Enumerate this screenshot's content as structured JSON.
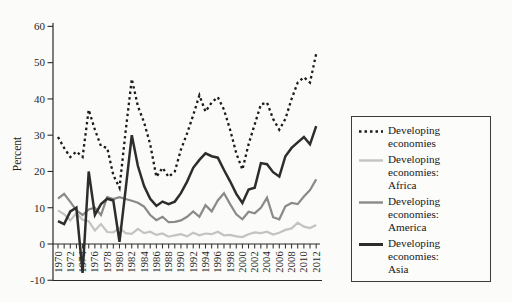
{
  "figure": {
    "background": "#fbfbf9",
    "axis_color": "#2a2a2a",
    "text_color": "#1f1f1f"
  },
  "chart_data": {
    "type": "line",
    "title": "",
    "xlabel": "",
    "ylabel": "Percent",
    "ylim": [
      -10,
      60
    ],
    "y_ticks": [
      60,
      50,
      40,
      30,
      20,
      10,
      0,
      -10
    ],
    "grid": "off",
    "legend_position": "right-box",
    "years": [
      1970,
      1971,
      1972,
      1973,
      1974,
      1975,
      1976,
      1977,
      1978,
      1979,
      1980,
      1981,
      1982,
      1983,
      1984,
      1985,
      1986,
      1987,
      1988,
      1989,
      1990,
      1991,
      1992,
      1993,
      1994,
      1995,
      1996,
      1997,
      1998,
      1999,
      2000,
      2001,
      2002,
      2003,
      2004,
      2005,
      2006,
      2007,
      2008,
      2009,
      2010,
      2011,
      2012
    ],
    "x_tick_labels": [
      "1970",
      "1972",
      "1974",
      "1976",
      "1978",
      "1980",
      "1982",
      "1984",
      "1986",
      "1988",
      "1990",
      "1992",
      "1994",
      "1996",
      "1998",
      "2000",
      "2002",
      "2004",
      "2006",
      "2008",
      "2010",
      "2012"
    ],
    "series": [
      {
        "name": "Developing economies",
        "style": "dotted",
        "color": "#1b1b1b",
        "width": 2.3,
        "values": [
          29.5,
          26.5,
          24,
          25.5,
          24,
          37,
          31.5,
          27,
          26.5,
          19,
          15.5,
          31,
          45.5,
          38,
          33.5,
          27.5,
          18.5,
          21,
          18.5,
          20,
          26,
          30.5,
          35.5,
          41,
          36.5,
          39,
          40.5,
          37,
          31.5,
          25,
          20.5,
          27.5,
          33,
          38.5,
          39,
          34.5,
          31.5,
          34.5,
          40,
          44.5,
          46,
          44.5,
          52.5
        ]
      },
      {
        "name": "Developing economies: Africa",
        "style": "solid",
        "color": "#c3c3c1",
        "width": 2.2,
        "values": [
          9.3,
          8.2,
          6.5,
          8.5,
          6.7,
          6.3,
          3.7,
          5.5,
          3.3,
          3.2,
          4.4,
          3,
          2.8,
          4.2,
          3,
          3.4,
          2.5,
          2.9,
          2,
          2.4,
          2.7,
          2.1,
          3.1,
          2.4,
          2.9,
          2.7,
          3.4,
          2.4,
          2.5,
          2.1,
          1.9,
          2.7,
          3.2,
          3,
          3.4,
          2.6,
          3.1,
          3.9,
          4.3,
          5.9,
          4.8,
          4.4,
          5.2
        ]
      },
      {
        "name": "Developing economies: America",
        "style": "solid",
        "color": "#8a8a88",
        "width": 2.2,
        "values": [
          12.5,
          13.8,
          11.6,
          9.3,
          8,
          9.5,
          10,
          8,
          12.9,
          12.4,
          12.9,
          12.4,
          11.9,
          11.4,
          10.3,
          8,
          6.6,
          7.5,
          6,
          6.1,
          6.5,
          7.5,
          9,
          7.5,
          10.7,
          9,
          12,
          14,
          11,
          8.2,
          6.8,
          8.9,
          8.5,
          10,
          12.8,
          7.4,
          6.8,
          10.4,
          11.3,
          11,
          13.1,
          14.9,
          17.8
        ]
      },
      {
        "name": "Developing economies: Asia",
        "style": "solid",
        "color": "#2d2d2d",
        "width": 2.5,
        "values": [
          6.3,
          5.5,
          9,
          10,
          -8,
          20,
          8,
          11,
          12.5,
          12,
          0.6,
          15,
          30,
          21.5,
          16,
          12.5,
          10.5,
          11.7,
          11,
          11.7,
          14,
          17.2,
          21,
          23.2,
          25,
          24.2,
          23.8,
          20.4,
          17.3,
          13.8,
          11.3,
          15,
          15.5,
          22.3,
          22,
          19.8,
          18.6,
          24.2,
          26.5,
          28,
          29.5,
          27.5,
          32.5
        ]
      }
    ],
    "legend": [
      {
        "line1": "Developing economies",
        "line2": ""
      },
      {
        "line1": "Developing economies:",
        "line2": "Africa"
      },
      {
        "line1": "Developing economies:",
        "line2": "America"
      },
      {
        "line1": "Developing economies:",
        "line2": "Asia"
      }
    ]
  }
}
